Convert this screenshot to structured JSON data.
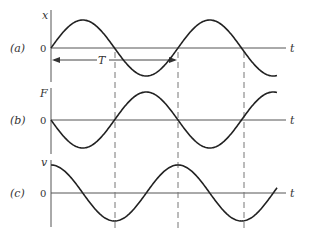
{
  "panels": [
    {
      "tag": "(a)",
      "var": "x",
      "zero": "0",
      "axis": "t",
      "curve": "sin"
    },
    {
      "tag": "(b)",
      "var": "F",
      "zero": "0",
      "axis": "t",
      "curve": "-sin"
    },
    {
      "tag": "(c)",
      "var": "v",
      "zero": "0",
      "axis": "t",
      "curve": "cos"
    }
  ],
  "period_label": "T",
  "colors": {
    "curve": "#222222",
    "axis": "#555555",
    "dash": "#777777"
  }
}
